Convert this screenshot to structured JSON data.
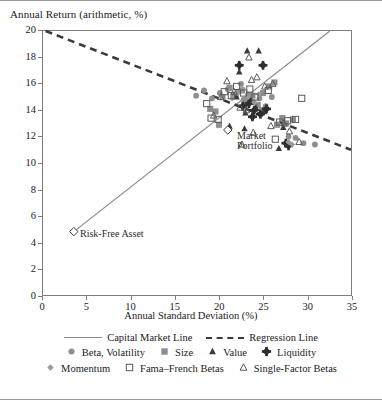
{
  "chart_data": {
    "type": "scatter",
    "title": "",
    "ylabel": "Annual Return (arithmetic, %)",
    "xlabel": "Annual Standard Deviation (%)",
    "xlim": [
      0,
      35
    ],
    "ylim": [
      0,
      20
    ],
    "xticks": [
      0,
      5,
      10,
      15,
      20,
      25,
      30,
      35
    ],
    "yticks": [
      0,
      2,
      4,
      6,
      8,
      10,
      12,
      14,
      16,
      18,
      20
    ],
    "grid": false,
    "legend_position": "below",
    "lines": [
      {
        "name": "Capital Market Line",
        "style": "solid",
        "color": "#8a8a8a",
        "points": [
          [
            3.5,
            4.8
          ],
          [
            32.6,
            20.0
          ]
        ]
      },
      {
        "name": "Regression Line",
        "style": "dashed",
        "color": "#3a3a3a",
        "points": [
          [
            0.3,
            20.0
          ],
          [
            35.0,
            11.0
          ]
        ]
      }
    ],
    "annotations": [
      {
        "label": "Risk-Free Asset",
        "x": 3.5,
        "y": 4.8,
        "marker": "open-diamond"
      },
      {
        "label": "Market Portfolio",
        "x": 21.0,
        "y": 12.5,
        "marker": "open-diamond"
      }
    ],
    "series": [
      {
        "name": "Beta, Volatility",
        "marker": "filled-circle",
        "color": "#8e8e8e",
        "points": [
          [
            17.4,
            15.1
          ],
          [
            18.3,
            15.5
          ],
          [
            19.2,
            14.9
          ],
          [
            20.1,
            15.3
          ],
          [
            21.0,
            15.6
          ],
          [
            21.6,
            15.1
          ],
          [
            22.2,
            15.4
          ],
          [
            22.8,
            14.8
          ],
          [
            23.3,
            15.2
          ],
          [
            23.9,
            14.6
          ],
          [
            24.6,
            14.9
          ],
          [
            25.3,
            14.3
          ],
          [
            26.0,
            15.0
          ],
          [
            28.7,
            11.9
          ],
          [
            29.6,
            11.5
          ],
          [
            30.9,
            11.4
          ],
          [
            27.9,
            12.0
          ],
          [
            22.5,
            16.0
          ]
        ]
      },
      {
        "name": "Size",
        "marker": "filled-square",
        "color": "#8e8e8e",
        "points": [
          [
            19.0,
            14.1
          ],
          [
            19.6,
            13.9
          ],
          [
            20.4,
            15.0
          ],
          [
            21.2,
            15.7
          ],
          [
            21.9,
            15.2
          ],
          [
            22.6,
            15.5
          ],
          [
            23.2,
            14.7
          ],
          [
            23.8,
            15.1
          ],
          [
            24.4,
            14.4
          ],
          [
            25.0,
            15.3
          ],
          [
            25.7,
            15.8
          ],
          [
            26.3,
            16.1
          ],
          [
            27.2,
            13.4
          ],
          [
            27.6,
            13.0
          ],
          [
            28.4,
            13.3
          ],
          [
            26.6,
            12.9
          ],
          [
            20.0,
            12.9
          ],
          [
            24.9,
            14.0
          ]
        ]
      },
      {
        "name": "Value",
        "marker": "filled-triangle",
        "color": "#3a3a3a",
        "points": [
          [
            23.2,
            18.5
          ],
          [
            24.5,
            18.5
          ],
          [
            22.3,
            16.9
          ],
          [
            21.2,
            12.8
          ],
          [
            22.9,
            12.6
          ],
          [
            27.3,
            12.7
          ],
          [
            26.8,
            11.1
          ],
          [
            23.6,
            14.8
          ],
          [
            24.2,
            14.2
          ],
          [
            25.1,
            13.9
          ],
          [
            22.0,
            15.0
          ],
          [
            23.0,
            13.8
          ]
        ]
      },
      {
        "name": "Liquidity",
        "marker": "filled-plus-diamond",
        "color": "#2e2e2e",
        "points": [
          [
            22.3,
            17.4
          ],
          [
            25.0,
            17.4
          ],
          [
            23.4,
            14.5
          ],
          [
            24.0,
            14.0
          ],
          [
            24.7,
            13.7
          ],
          [
            25.4,
            14.1
          ],
          [
            23.8,
            13.5
          ],
          [
            27.6,
            11.5
          ],
          [
            27.9,
            11.3
          ],
          [
            22.7,
            14.3
          ]
        ]
      },
      {
        "name": "Momentum",
        "marker": "small-filled-diamond",
        "color": "#9a9a9a",
        "points": [
          [
            21.5,
            14.9
          ],
          [
            22.1,
            15.3
          ],
          [
            22.7,
            15.6
          ],
          [
            23.3,
            15.0
          ],
          [
            24.0,
            14.6
          ],
          [
            27.9,
            11.6
          ],
          [
            28.3,
            11.4
          ],
          [
            24.5,
            15.2
          ]
        ]
      },
      {
        "name": "Fama–French Betas",
        "marker": "open-square",
        "color": "#5a5a5a",
        "points": [
          [
            18.6,
            14.5
          ],
          [
            19.1,
            13.4
          ],
          [
            19.9,
            13.3
          ],
          [
            20.6,
            15.4
          ],
          [
            21.4,
            15.1
          ],
          [
            22.0,
            15.8
          ],
          [
            22.8,
            15.3
          ],
          [
            23.5,
            15.6
          ],
          [
            24.1,
            15.0
          ],
          [
            25.6,
            15.5
          ],
          [
            26.9,
            13.1
          ],
          [
            27.8,
            13.2
          ],
          [
            28.7,
            13.3
          ],
          [
            26.4,
            11.8
          ],
          [
            29.4,
            14.9
          ]
        ]
      },
      {
        "name": "Single-Factor Betas",
        "marker": "open-triangle",
        "color": "#5a5a5a",
        "points": [
          [
            19.4,
            13.6
          ],
          [
            20.2,
            15.0
          ],
          [
            20.9,
            16.2
          ],
          [
            21.7,
            15.4
          ],
          [
            22.4,
            14.2
          ],
          [
            23.1,
            14.0
          ],
          [
            23.7,
            16.3
          ],
          [
            24.3,
            16.5
          ],
          [
            25.2,
            15.8
          ],
          [
            26.1,
            16.0
          ],
          [
            25.9,
            12.8
          ],
          [
            27.4,
            13.0
          ],
          [
            28.0,
            12.4
          ],
          [
            29.1,
            11.6
          ],
          [
            23.9,
            12.3
          ],
          [
            23.4,
            18.0
          ],
          [
            22.6,
            11.4
          ]
        ]
      }
    ]
  },
  "legend": {
    "rows": [
      [
        {
          "label": "Capital Market Line",
          "swatch": "solid-line"
        },
        {
          "label": "Regression Line",
          "swatch": "dashed-line"
        }
      ],
      [
        {
          "label": "Beta, Volatility",
          "swatch": "filled-circle"
        },
        {
          "label": "Size",
          "swatch": "filled-square"
        },
        {
          "label": "Value",
          "swatch": "filled-triangle"
        },
        {
          "label": "Liquidity",
          "swatch": "filled-plus-diamond"
        }
      ],
      [
        {
          "label": "Momentum",
          "swatch": "small-filled-diamond"
        },
        {
          "label": "Fama–French Betas",
          "swatch": "open-square"
        },
        {
          "label": "Single-Factor Betas",
          "swatch": "open-triangle"
        }
      ]
    ]
  }
}
